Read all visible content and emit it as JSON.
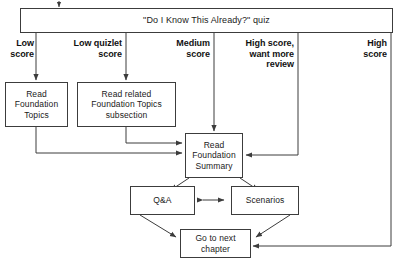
{
  "diagram": {
    "title": "\"Do I Know This Already?\" quiz",
    "nodes": {
      "quiz": "\"Do I Know This Already?\" quiz",
      "read_foundation_topics": "Read Foundation Topics",
      "read_related_subsection": "Read related Foundation Topics subsection",
      "read_foundation_summary": "Read Foundation Summary",
      "qanda": "Q&A",
      "scenarios": "Scenarios",
      "go_next_chapter": "Go to next chapter"
    },
    "branch_labels": {
      "low_score": "Low score",
      "low_quizlet_score": "Low quizlet score",
      "medium_score": "Medium score",
      "high_score_want_more_review": "High score, want more review",
      "high_score": "High score"
    },
    "colors": {
      "stroke": "#3c3c3c",
      "text": "#1a1a1a",
      "background": "#ffffff"
    }
  }
}
